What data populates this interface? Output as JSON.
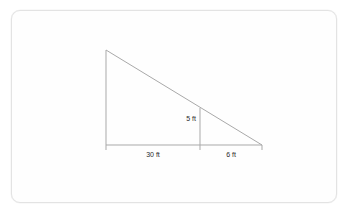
{
  "figure": {
    "kind": "right-triangle-diagram",
    "colors": {
      "line": "#a9a9a9",
      "label_text": "#2b2b2b",
      "card_background": "#fefefe",
      "card_border": "#e3e3e3",
      "page_background": "#ffffff"
    },
    "labels": {
      "height_inner": "5 ft",
      "base_left": "30 ft",
      "base_right": "6 ft"
    },
    "geometry": {
      "apex": {
        "x": 106,
        "y": 50
      },
      "bottom_left": {
        "x": 106,
        "y": 145
      },
      "bottom_right": {
        "x": 262,
        "y": 145
      },
      "inner_vertical_top": {
        "x": 200,
        "y": 108
      },
      "inner_vertical_bottom": {
        "x": 200,
        "y": 145
      },
      "tick_left": {
        "x": 106,
        "y": 145
      },
      "tick_mid": {
        "x": 200,
        "y": 145
      },
      "tick_right": {
        "x": 262,
        "y": 145
      }
    },
    "label_positions": {
      "height_inner": {
        "x": 196,
        "y": 121
      },
      "base_left": {
        "x": 153,
        "y": 157
      },
      "base_right": {
        "x": 231,
        "y": 157
      }
    }
  }
}
